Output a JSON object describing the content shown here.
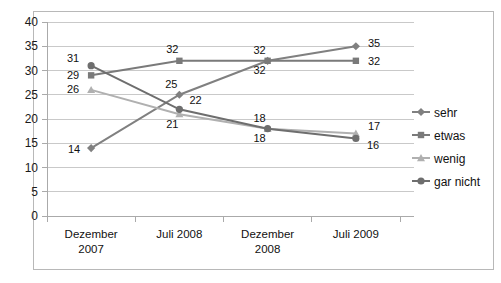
{
  "chart_data": {
    "type": "line",
    "title": "",
    "subtitle": "",
    "xlabel": "",
    "ylabel": "",
    "categories": [
      "Dezember 2007",
      "Juli 2008",
      "Dezember 2008",
      "Juli 2009"
    ],
    "category_lines": [
      [
        "Dezember",
        "2007"
      ],
      [
        "Juli 2008",
        ""
      ],
      [
        "Dezember",
        "2008"
      ],
      [
        "Juli 2009",
        ""
      ]
    ],
    "ylim": [
      0,
      40
    ],
    "ytick_step": 5,
    "yticks": [
      "0",
      "5",
      "10",
      "15",
      "20",
      "25",
      "30",
      "35",
      "40"
    ],
    "grid": true,
    "legend_position": "right",
    "series": [
      {
        "name": "sehr",
        "marker": "diamond",
        "color": "#808080",
        "values": [
          14,
          25,
          32,
          35
        ],
        "labels": [
          "14",
          "25",
          "32",
          "35"
        ]
      },
      {
        "name": "etwas",
        "marker": "square",
        "color": "#7a7a7a",
        "values": [
          29,
          32,
          32,
          32
        ],
        "labels": [
          "29",
          "32",
          "32",
          "32"
        ]
      },
      {
        "name": "wenig",
        "marker": "triangle",
        "color": "#b0b0b0",
        "values": [
          26,
          21,
          18,
          17
        ],
        "labels": [
          "26",
          "21",
          "18",
          "17"
        ]
      },
      {
        "name": "gar nicht",
        "marker": "circle",
        "color": "#6e6e6e",
        "values": [
          31,
          22,
          18,
          16
        ],
        "labels": [
          "31",
          "22",
          "18",
          "16"
        ]
      }
    ]
  },
  "legend": {
    "items": [
      {
        "label": "sehr"
      },
      {
        "label": "etwas"
      },
      {
        "label": "wenig"
      },
      {
        "label": "gar nicht"
      }
    ]
  },
  "colors": {
    "grid": "#c9c9c9",
    "axis": "#aaaaaa",
    "border": "#b8b8b8",
    "background": "#ffffff",
    "text": "#111111"
  }
}
